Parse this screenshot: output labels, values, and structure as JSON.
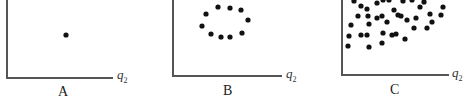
{
  "chart_data": [
    {
      "type": "scatter",
      "title": "A",
      "xlabel": "q2",
      "ylabel": "",
      "grid": false,
      "description": "Single point",
      "points": [
        [
          66,
          35
        ]
      ]
    },
    {
      "type": "scatter",
      "title": "B",
      "xlabel": "q2",
      "ylabel": "",
      "grid": false,
      "description": "Points arranged in an elliptical ring",
      "points": [
        [
          218,
          7
        ],
        [
          230,
          8
        ],
        [
          241,
          10
        ],
        [
          206,
          14
        ],
        [
          248,
          20
        ],
        [
          202,
          26
        ],
        [
          211,
          34
        ],
        [
          221,
          37
        ],
        [
          230,
          37
        ],
        [
          242,
          33
        ]
      ]
    },
    {
      "type": "scatter",
      "title": "C",
      "xlabel": "q2",
      "ylabel": "",
      "grid": false,
      "description": "Dense scattered cloud of points",
      "points": [
        [
          354,
          1
        ],
        [
          361,
          6
        ],
        [
          367,
          9
        ],
        [
          377,
          3
        ],
        [
          383,
          0
        ],
        [
          389,
          0
        ],
        [
          394,
          10
        ],
        [
          403,
          1
        ],
        [
          412,
          0
        ],
        [
          420,
          7
        ],
        [
          424,
          2
        ],
        [
          443,
          7
        ],
        [
          358,
          16
        ],
        [
          368,
          16
        ],
        [
          377,
          18
        ],
        [
          382,
          16
        ],
        [
          387,
          22
        ],
        [
          398,
          15
        ],
        [
          407,
          20
        ],
        [
          401,
          16
        ],
        [
          416,
          18
        ],
        [
          430,
          14
        ],
        [
          441,
          15
        ],
        [
          351,
          25
        ],
        [
          369,
          24
        ],
        [
          414,
          28
        ],
        [
          427,
          28
        ],
        [
          349,
          36
        ],
        [
          361,
          35
        ],
        [
          367,
          35
        ],
        [
          383,
          33
        ],
        [
          392,
          35
        ],
        [
          396,
          34
        ],
        [
          405,
          39
        ],
        [
          382,
          43
        ],
        [
          348,
          46
        ],
        [
          369,
          47
        ],
        [
          432,
          22
        ]
      ]
    }
  ],
  "panels": [
    {
      "label": "A",
      "axis_label": "q",
      "axis_sub": "2"
    },
    {
      "label": "B",
      "axis_label": "q",
      "axis_sub": "2"
    },
    {
      "label": "C",
      "axis_label": "q",
      "axis_sub": "2"
    }
  ]
}
